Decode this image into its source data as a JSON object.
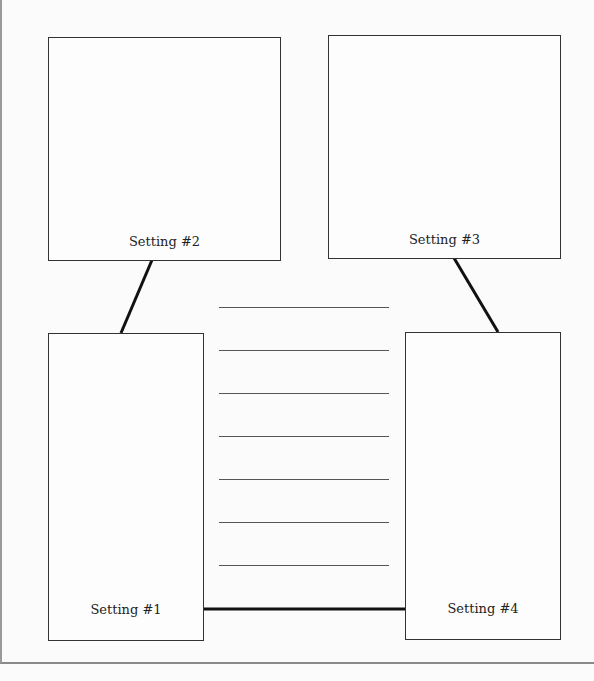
{
  "diagram": {
    "settings": [
      {
        "id": 1,
        "label": "Setting #1"
      },
      {
        "id": 2,
        "label": "Setting #2"
      },
      {
        "id": 3,
        "label": "Setting #3"
      },
      {
        "id": 4,
        "label": "Setting #4"
      }
    ],
    "writing_lines_count": 7,
    "connections": [
      {
        "from": "Setting #2",
        "to": "Setting #1"
      },
      {
        "from": "Setting #3",
        "to": "Setting #4"
      },
      {
        "from": "Setting #1",
        "to": "Setting #4"
      }
    ],
    "colors": {
      "line": "#333333",
      "background": "#fbfbfb"
    }
  }
}
